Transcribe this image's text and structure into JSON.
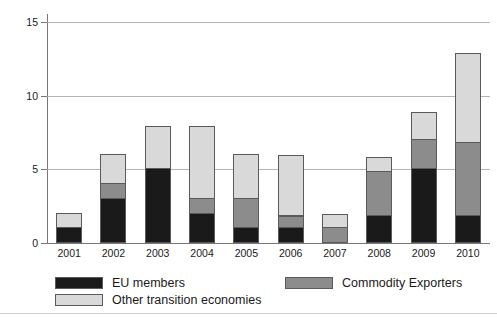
{
  "chart_data": {
    "type": "bar",
    "subtype": "stacked-vertical",
    "title": "",
    "xlabel": "",
    "ylabel": "",
    "categories": [
      "2001",
      "2002",
      "2003",
      "2004",
      "2005",
      "2006",
      "2007",
      "2008",
      "2009",
      "2010"
    ],
    "series": [
      {
        "name": "EU members",
        "color": "#1a1a1a",
        "values": [
          1.0,
          3.0,
          5.0,
          2.0,
          1.0,
          1.0,
          0.0,
          1.8,
          5.0,
          1.8
        ]
      },
      {
        "name": "Commodity Exporters",
        "color": "#8c8c8c",
        "values": [
          0.0,
          1.0,
          0.0,
          1.0,
          2.0,
          0.8,
          1.0,
          3.0,
          2.0,
          5.0
        ]
      },
      {
        "name": "Other transition economies",
        "color": "#d9d9d9",
        "values": [
          1.0,
          2.0,
          2.9,
          4.9,
          3.0,
          4.1,
          0.9,
          1.0,
          1.8,
          6.0
        ]
      }
    ],
    "totals": [
      2.0,
      6.0,
      7.9,
      7.9,
      6.0,
      5.9,
      1.9,
      5.8,
      8.8,
      12.8
    ],
    "ylim": [
      0,
      15
    ],
    "yticks": [
      0,
      5,
      10,
      15
    ],
    "ytick_labels": [
      "0",
      "5",
      "10",
      "15"
    ],
    "grid": "horizontal",
    "legend_position": "bottom"
  },
  "legend": {
    "entries": [
      {
        "label": "EU members",
        "color": "#1a1a1a"
      },
      {
        "label": "Commodity Exporters",
        "color": "#8c8c8c"
      },
      {
        "label": "Other transition economies",
        "color": "#d9d9d9"
      }
    ]
  }
}
